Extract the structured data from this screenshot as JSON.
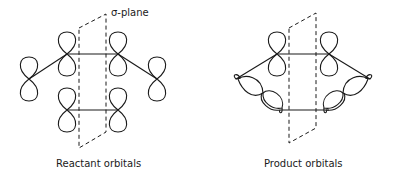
{
  "diagram": {
    "reactant": {
      "caption": "Reactant orbitals",
      "plane_label": "σ-plane"
    },
    "product": {
      "caption": "Product orbitals"
    },
    "line_color": "#1a1a1a",
    "background": "#ffffff"
  }
}
